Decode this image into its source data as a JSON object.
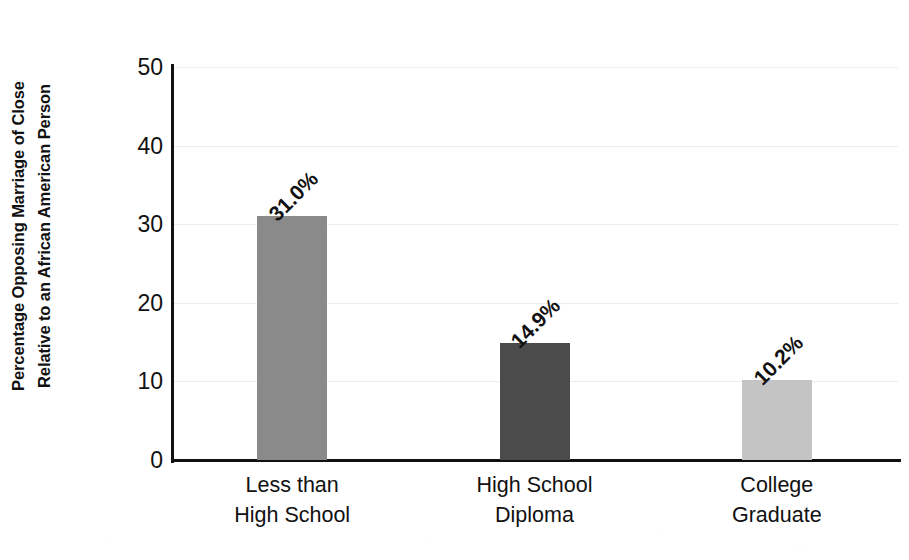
{
  "chart_data": {
    "type": "bar",
    "title": "",
    "subtitle": "",
    "xlabel": "",
    "ylabel": "Percentage Opposing Marriage of Close Relative to an African American Person",
    "ylabel_lines": [
      "Percentage Opposing Marriage of Close",
      "Relative to an African American Person"
    ],
    "categories": [
      "Less than High School",
      "High School Diploma",
      "College Graduate"
    ],
    "category_lines": [
      [
        "Less than",
        "High School"
      ],
      [
        "High School",
        "Diploma"
      ],
      [
        "College",
        "Graduate"
      ]
    ],
    "values": [
      31.0,
      14.9,
      10.2
    ],
    "value_labels": [
      "31.0%",
      "14.9%",
      "10.2%"
    ],
    "bar_colors": [
      "#8a8a8a",
      "#4b4b4b",
      "#c4c4c4"
    ],
    "ylim": [
      0,
      50
    ],
    "yticks": [
      50,
      40,
      30,
      20,
      10,
      0
    ],
    "ytick_labels": [
      "50",
      "40",
      "30",
      "20",
      "10",
      "0"
    ],
    "grid": true,
    "grid_color": "#ededed",
    "legend": false,
    "legend_position": "none",
    "axis_color": "#111111",
    "value_label_rotation_deg": -45
  }
}
